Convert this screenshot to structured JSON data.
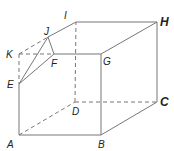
{
  "diagram": {
    "type": "cube-with-truncated-corner",
    "labels": {
      "A": "A",
      "B": "B",
      "C": "C",
      "D": "D",
      "E": "E",
      "F": "F",
      "G": "G",
      "H": "H",
      "I": "I",
      "J": "J",
      "K": "K"
    },
    "points": {
      "A": [
        19,
        135
      ],
      "B": [
        101,
        135
      ],
      "C": [
        157,
        102
      ],
      "D": [
        75,
        102
      ],
      "E": [
        19,
        84
      ],
      "F": [
        54,
        54
      ],
      "G": [
        101,
        54
      ],
      "H": [
        157,
        22
      ],
      "I": [
        76,
        22
      ],
      "J": [
        48,
        37
      ],
      "K": [
        19,
        54
      ]
    },
    "solid_edges": [
      [
        "A",
        "B"
      ],
      [
        "B",
        "C"
      ],
      [
        "C",
        "H"
      ],
      [
        "H",
        "I"
      ],
      [
        "I",
        "J"
      ],
      [
        "J",
        "E"
      ],
      [
        "E",
        "A"
      ],
      [
        "E",
        "F"
      ],
      [
        "F",
        "J"
      ],
      [
        "F",
        "G"
      ],
      [
        "G",
        "B"
      ],
      [
        "G",
        "H"
      ]
    ],
    "hidden_edges": [
      [
        "A",
        "D"
      ],
      [
        "D",
        "C"
      ],
      [
        "D",
        "I"
      ],
      [
        "K",
        "E"
      ],
      [
        "K",
        "J"
      ],
      [
        "K",
        "F"
      ]
    ],
    "colors": {
      "line": "#777777",
      "text": "#222222"
    }
  }
}
